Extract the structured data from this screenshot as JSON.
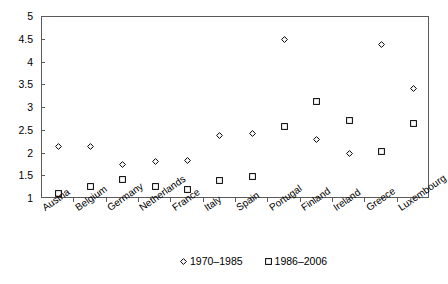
{
  "chart_data": {
    "type": "scatter",
    "title": "",
    "subtitle": "",
    "xlabel": "",
    "ylabel": "",
    "ylim": [
      1,
      5
    ],
    "yticks": [
      1,
      1.5,
      2,
      2.5,
      3,
      3.5,
      4,
      4.5,
      5
    ],
    "ytick_labels": [
      "1",
      "1.5",
      "2",
      "2.5",
      "3",
      "3.5",
      "4",
      "4.5",
      "5"
    ],
    "grid": false,
    "legend_position": "bottom-center",
    "categories": [
      "Austria",
      "Belgium",
      "Germany",
      "Netherlands",
      "France",
      "Italy",
      "Spain",
      "Portugal",
      "Finland",
      "Ireland",
      "Greece",
      "Luxembourg"
    ],
    "series": [
      {
        "name": "1970–1985",
        "marker": "diamond",
        "color": "#000000",
        "values": [
          2.15,
          2.16,
          1.75,
          1.82,
          1.84,
          2.4,
          2.43,
          4.5,
          2.3,
          2.0,
          4.4,
          3.42
        ]
      },
      {
        "name": "1986–2006",
        "marker": "square",
        "color": "#000000",
        "values": [
          1.12,
          1.27,
          1.43,
          1.28,
          1.21,
          1.41,
          1.5,
          2.6,
          3.15,
          2.72,
          2.05,
          2.65
        ]
      }
    ]
  },
  "legend": {
    "entries": [
      {
        "label": "1970–1985",
        "marker": "diamond"
      },
      {
        "label": "1986–2006",
        "marker": "square"
      }
    ]
  }
}
